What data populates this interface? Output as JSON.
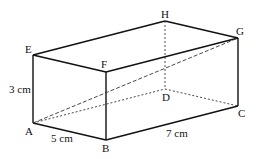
{
  "diagram": {
    "type": "cuboid",
    "vertices": {
      "A": {
        "label": "A"
      },
      "B": {
        "label": "B"
      },
      "C": {
        "label": "C"
      },
      "D": {
        "label": "D"
      },
      "E": {
        "label": "E"
      },
      "F": {
        "label": "F"
      },
      "G": {
        "label": "G"
      },
      "H": {
        "label": "H"
      }
    },
    "dimensions": {
      "height": "3 cm",
      "width": "5 cm",
      "length": "7 cm"
    },
    "hidden_edges": [
      "HD",
      "AD",
      "DC"
    ],
    "diagonal": "AG"
  }
}
